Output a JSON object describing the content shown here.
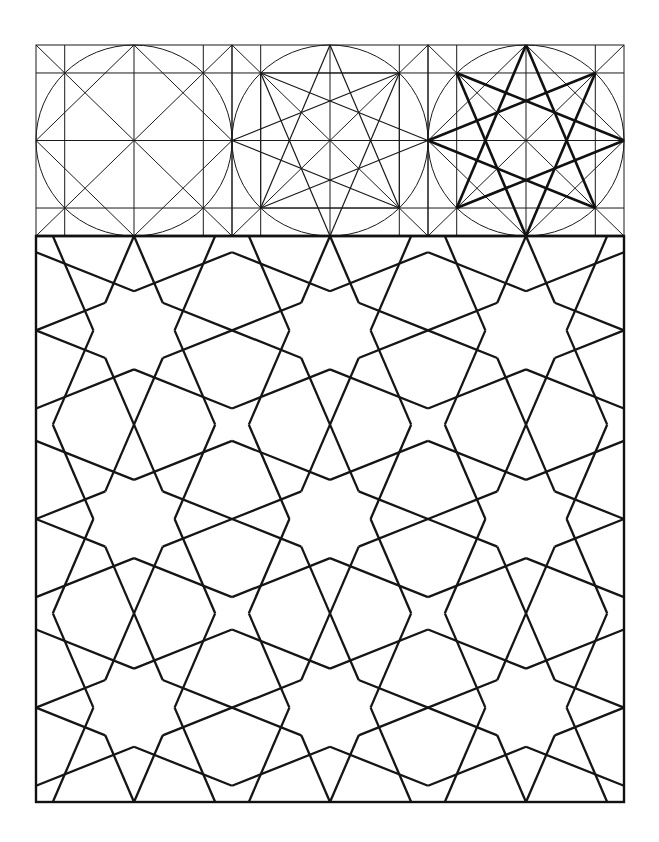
{
  "figure": {
    "title": "",
    "colors": {
      "line": "#1a1a1a",
      "background": "#ffffff"
    }
  },
  "frame": {
    "left": 36,
    "right": 624,
    "top": 45,
    "divider": 236,
    "bottom": 802
  },
  "construction_panels": [
    {
      "id": "panel-1",
      "name": "circle-square-grid",
      "x": 36,
      "width": 196,
      "features": [
        "circle",
        "diagonals",
        "center-cross",
        "inner-square-grid",
        "diamond"
      ]
    },
    {
      "id": "panel-2",
      "name": "eight-point-construction",
      "x": 232,
      "width": 196,
      "features": [
        "circle",
        "diagonals",
        "center-cross",
        "inner-square-grid",
        "star-8-3-thin"
      ]
    },
    {
      "id": "panel-3",
      "name": "eight-point-star-highlighted",
      "x": 428,
      "width": 196,
      "features": [
        "circle",
        "diagonals",
        "center-cross",
        "inner-square-grid",
        "diamond",
        "star-8-3-bold"
      ]
    }
  ],
  "tessellation": {
    "tile_size": 196,
    "columns": 3,
    "rows": 3,
    "origin_x": 36,
    "origin_y": 236,
    "vertical_scale": 0.9626,
    "star_vertex_radius": 40.6,
    "arm_angle_deg": 67.5,
    "axial_arm_length": 106,
    "diagonal_arm_length": 75
  }
}
